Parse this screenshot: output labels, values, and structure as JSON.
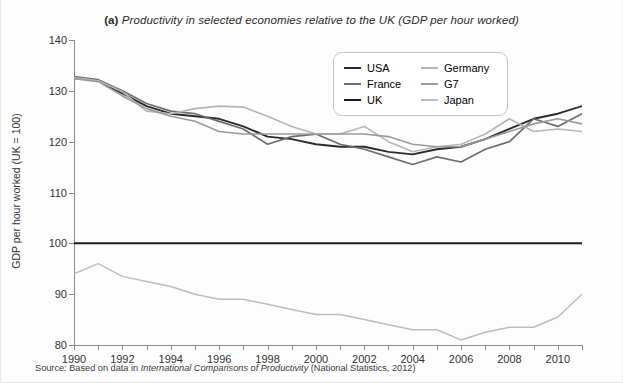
{
  "title": {
    "tag": "(a)",
    "text": "Productivity in selected economies relative to the UK (GDP per hour worked)"
  },
  "source": {
    "prefix": "Source: Based on data in ",
    "italic": "International Comparisons of Productivity",
    "suffix": " (National Statistics, 2012)"
  },
  "legend": {
    "position": "inside-top-right",
    "items": [
      {
        "label": "USA",
        "color": "#2b2b2b"
      },
      {
        "label": "Germany",
        "color": "#b6b6b6"
      },
      {
        "label": "France",
        "color": "#6e6e6e"
      },
      {
        "label": "G7",
        "color": "#9a9a9a"
      },
      {
        "label": "UK",
        "color": "#1c1c1c"
      },
      {
        "label": "Japan",
        "color": "#bdbdbd"
      }
    ]
  },
  "chart_data": {
    "type": "line",
    "title": "(a) Productivity in selected economies relative to the UK (GDP per hour worked)",
    "xlabel": "",
    "ylabel": "GDP per hour worked (UK = 100)",
    "xlim": [
      1990,
      2011
    ],
    "ylim": [
      80,
      140
    ],
    "yticks": [
      80,
      90,
      100,
      110,
      120,
      130,
      140
    ],
    "xticks": [
      1990,
      1991,
      1992,
      1993,
      1994,
      1995,
      1996,
      1997,
      1998,
      1999,
      2000,
      2001,
      2002,
      2003,
      2004,
      2005,
      2006,
      2007,
      2008,
      2009,
      2010,
      2011
    ],
    "xtick_labels": [
      1990,
      1992,
      1994,
      1996,
      1998,
      2000,
      2002,
      2004,
      2006,
      2008,
      2010
    ],
    "grid": false,
    "legend_position": "upper right",
    "x": [
      1990,
      1991,
      1992,
      1993,
      1994,
      1995,
      1996,
      1997,
      1998,
      1999,
      2000,
      2001,
      2002,
      2003,
      2004,
      2005,
      2006,
      2007,
      2008,
      2009,
      2010,
      2011
    ],
    "series": [
      {
        "name": "USA",
        "color": "#2b2b2b",
        "width": 1.9,
        "values": [
          132.5,
          132.0,
          129.5,
          127.0,
          125.5,
          125.0,
          124.5,
          123.0,
          121.0,
          120.5,
          119.5,
          119.0,
          119.0,
          118.0,
          117.5,
          118.5,
          119.0,
          120.5,
          122.5,
          124.5,
          125.5,
          127.0
        ]
      },
      {
        "name": "France",
        "color": "#6e6e6e",
        "width": 1.7,
        "values": [
          132.8,
          132.2,
          130.0,
          127.5,
          126.0,
          125.5,
          124.0,
          122.5,
          119.5,
          121.0,
          121.5,
          119.5,
          118.5,
          117.0,
          115.5,
          117.0,
          116.0,
          118.5,
          120.0,
          124.5,
          123.0,
          125.5
        ]
      },
      {
        "name": "UK",
        "color": "#1c1c1c",
        "width": 2.0,
        "values": [
          100,
          100,
          100,
          100,
          100,
          100,
          100,
          100,
          100,
          100,
          100,
          100,
          100,
          100,
          100,
          100,
          100,
          100,
          100,
          100,
          100,
          100
        ]
      },
      {
        "name": "Germany",
        "color": "#b6b6b6",
        "width": 1.6,
        "values": [
          132.6,
          132.0,
          129.8,
          126.0,
          125.5,
          126.5,
          127.0,
          126.8,
          125.0,
          123.0,
          121.5,
          121.5,
          123.0,
          120.0,
          118.0,
          119.0,
          119.5,
          121.5,
          124.5,
          122.0,
          122.5,
          122.0
        ]
      },
      {
        "name": "G7",
        "color": "#9a9a9a",
        "width": 1.6,
        "values": [
          132.4,
          131.8,
          129.0,
          126.5,
          125.0,
          124.0,
          122.0,
          121.5,
          121.5,
          121.5,
          121.5,
          121.5,
          121.5,
          121.0,
          119.5,
          119.0,
          119.0,
          120.5,
          122.0,
          123.5,
          124.5,
          123.5
        ]
      },
      {
        "name": "Japan",
        "color": "#bdbdbd",
        "width": 1.5,
        "values": [
          94.0,
          96.0,
          93.5,
          92.5,
          91.5,
          90.0,
          89.0,
          89.0,
          88.0,
          87.0,
          86.0,
          86.0,
          85.0,
          84.0,
          83.0,
          83.0,
          81.0,
          82.5,
          83.5,
          83.5,
          85.5,
          90.0
        ]
      }
    ]
  }
}
